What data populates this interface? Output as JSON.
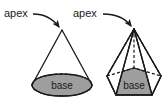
{
  "figure": {
    "background_color": "#ffffff",
    "stroke_color": "#1a1a1a",
    "base_fill_color": "#9e9e9e",
    "face_fill_color": "#ffffff",
    "text_color": "#1a1a1a"
  },
  "shapes": [
    {
      "id": "cone",
      "name": "cone",
      "apex_label": "apex",
      "base_label": "base",
      "apex_point": {
        "x": 62,
        "y": 30
      },
      "base_center": {
        "x": 62,
        "y": 85
      },
      "base_rx": 30,
      "base_ry": 11,
      "base_style": "ellipse",
      "hidden_edge_style": "dashed"
    },
    {
      "id": "pyramid",
      "name": "pentagonal-pyramid",
      "apex_label": "apex",
      "base_label": "base",
      "apex_point": {
        "x": 134,
        "y": 29
      },
      "base_center": {
        "x": 134,
        "y": 84
      },
      "base_style": "pentagon",
      "hidden_edge_style": "dashed",
      "visible_lateral_edges": 3,
      "hidden_lateral_edges": 2
    }
  ],
  "annotations": [
    {
      "id": "cone-apex-annotation",
      "label": "apex",
      "text_x": 4,
      "text_y": 17,
      "arrow_from": {
        "x": 33,
        "y": 14
      },
      "arrow_to": {
        "x": 60,
        "y": 28
      },
      "arrow_head": "filled-triangle"
    },
    {
      "id": "pyramid-apex-annotation",
      "label": "apex",
      "text_x": 73,
      "text_y": 17,
      "arrow_from": {
        "x": 103,
        "y": 14
      },
      "arrow_to": {
        "x": 132,
        "y": 27
      },
      "arrow_head": "filled-triangle"
    }
  ],
  "labels": {
    "cone_apex": "apex",
    "cone_base": "base",
    "pyramid_apex": "apex",
    "pyramid_base": "base"
  }
}
